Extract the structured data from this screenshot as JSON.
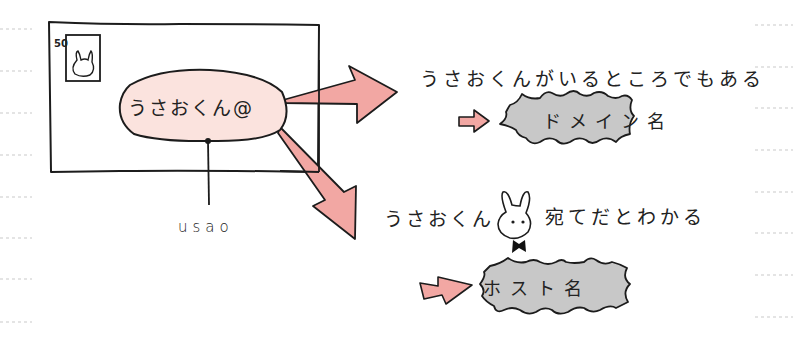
{
  "diagram": {
    "envelope": {
      "stamp_value": "50",
      "address_bubble": "うさおくん@",
      "username_label": "usao"
    },
    "explanations": {
      "domain_caption": "うさおくんがいるところでもある",
      "domain_term": "ドメイン名",
      "host_caption_before": "うさおくん",
      "host_caption_after": "宛てだとわかる",
      "host_term": "ホスト名"
    },
    "colors": {
      "arrow_fill": "#f2a7a3",
      "bubble_fill": "#fbe3de",
      "burst_fill": "#c8c8c8",
      "ink": "#1c1c1c",
      "ruled_line": "#c9c9c9"
    },
    "icons": {
      "stamp": "rabbit-stamp-icon",
      "mascot": "rabbit-with-bowtie-icon"
    }
  }
}
